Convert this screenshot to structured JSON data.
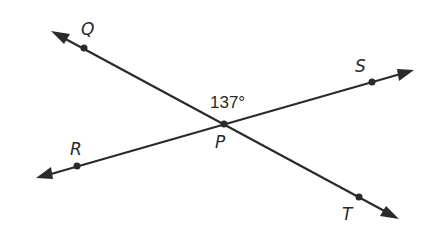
{
  "figure": {
    "angle_label": "137°",
    "intersection_label": "P",
    "lines": [
      {
        "name": "QT",
        "endpoints": [
          "Q",
          "T"
        ]
      },
      {
        "name": "RS",
        "endpoints": [
          "R",
          "S"
        ]
      }
    ],
    "points": {
      "Q": "Q",
      "R": "R",
      "S": "S",
      "T": "T",
      "P": "P"
    },
    "colors": {
      "ink": "#2a2a2a",
      "background": "#ffffff"
    }
  }
}
